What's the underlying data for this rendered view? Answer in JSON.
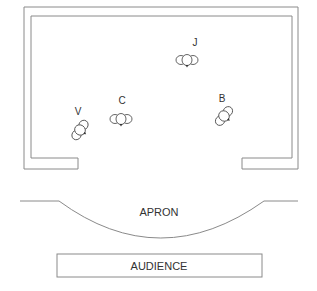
{
  "diagram": {
    "type": "stage-blocking",
    "colors": {
      "line": "#8a8a8a",
      "text": "#333333",
      "background": "#ffffff"
    },
    "actors": [
      {
        "id": "V",
        "label": "V",
        "x": 80,
        "y": 130,
        "rotation": -55,
        "label_x": 78,
        "label_y": 112
      },
      {
        "id": "C",
        "label": "C",
        "x": 121,
        "y": 119,
        "rotation": 0,
        "label_x": 122,
        "label_y": 101
      },
      {
        "id": "J",
        "label": "J",
        "x": 187,
        "y": 60,
        "rotation": 0,
        "label_x": 195,
        "label_y": 43
      },
      {
        "id": "B",
        "label": "B",
        "x": 224,
        "y": 116,
        "rotation": -50,
        "label_x": 222,
        "label_y": 99
      }
    ],
    "apron": {
      "label": "APRON"
    },
    "audience": {
      "label": "AUDIENCE"
    }
  }
}
